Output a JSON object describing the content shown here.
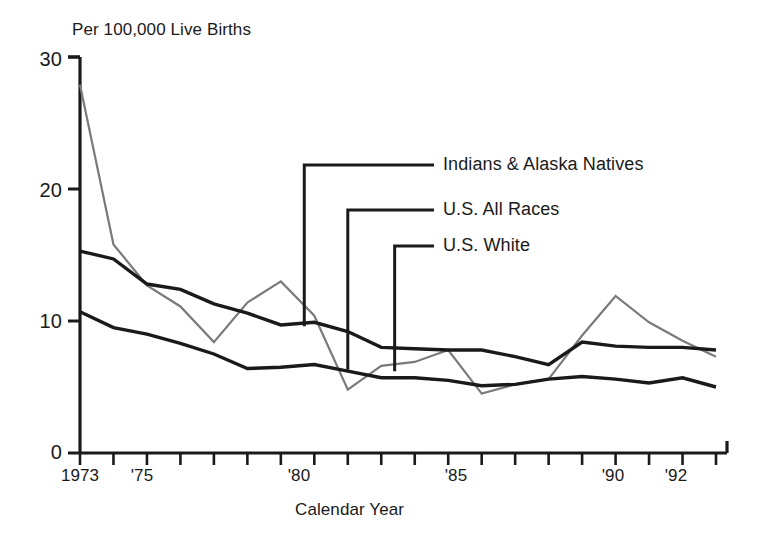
{
  "chart_data": {
    "type": "line",
    "title": "Per 100,000 Live Births",
    "subtitle": "",
    "xlabel": "Calendar Year",
    "ylabel": "Per 100,000 Live Births",
    "xlim": [
      1973,
      1992
    ],
    "ylim": [
      0,
      30
    ],
    "yticks": [
      0,
      10,
      20,
      30
    ],
    "ytick_labels": [
      "0",
      "10",
      "20",
      "30"
    ],
    "xticks": [
      1973,
      1974,
      1975,
      1976,
      1977,
      1978,
      1979,
      1980,
      1981,
      1982,
      1983,
      1984,
      1985,
      1986,
      1987,
      1988,
      1989,
      1990,
      1991,
      1992
    ],
    "xtick_labels_shown": [
      {
        "year": 1973,
        "label": "1973"
      },
      {
        "year": 1975,
        "label": "'75"
      },
      {
        "year": 1980,
        "label": "'80"
      },
      {
        "year": 1985,
        "label": "'85"
      },
      {
        "year": 1990,
        "label": "'90"
      },
      {
        "year": 1992,
        "label": "'92"
      }
    ],
    "grid": false,
    "legend_position": "inline-leader-lines",
    "x": [
      1973,
      1974,
      1975,
      1976,
      1977,
      1978,
      1979,
      1980,
      1981,
      1982,
      1983,
      1984,
      1985,
      1986,
      1987,
      1988,
      1989,
      1990,
      1991,
      1992
    ],
    "series": [
      {
        "name": "Indians & Alaska Natives",
        "color": "#7a7a7a",
        "values": [
          27.9,
          15.8,
          12.7,
          11.1,
          8.4,
          11.4,
          13.0,
          10.4,
          4.8,
          6.6,
          6.9,
          7.8,
          4.5,
          5.2,
          5.6,
          8.9,
          11.9,
          9.9,
          8.5,
          7.3
        ]
      },
      {
        "name": "U.S. All Races",
        "color": "#1a1a1a",
        "values": [
          15.3,
          14.7,
          12.8,
          12.4,
          11.3,
          10.6,
          9.7,
          9.9,
          9.2,
          8.0,
          7.9,
          7.8,
          7.8,
          7.3,
          6.7,
          8.4,
          8.1,
          8.0,
          8.0,
          7.8
        ]
      },
      {
        "name": "U.S. White",
        "color": "#1a1a1a",
        "values": [
          10.7,
          9.5,
          9.0,
          8.3,
          7.5,
          6.4,
          6.5,
          6.7,
          6.2,
          5.7,
          5.7,
          5.5,
          5.1,
          5.2,
          5.6,
          5.8,
          5.6,
          5.3,
          5.7,
          5.0
        ]
      }
    ],
    "annotations": [
      {
        "label": "Indians & Alaska Natives",
        "leader_from_year": 1979.7,
        "leader_from_value": 9.6
      },
      {
        "label": "U.S. All Races",
        "leader_from_year": 1981.0,
        "leader_from_value": 6.3
      },
      {
        "label": "U.S. White",
        "leader_from_year": 1982.4,
        "leader_from_value": 6.2
      }
    ]
  },
  "axes": {
    "y_tick_labels": [
      "30",
      "20",
      "10",
      "0"
    ],
    "x_tick_labels": [
      "1973",
      "'75",
      "'80",
      "'85",
      "'90",
      "'92"
    ],
    "x_axis_title": "Calendar Year",
    "plot_title": "Per 100,000 Live Births"
  },
  "legend": {
    "entries": [
      {
        "label": "Indians & Alaska Natives"
      },
      {
        "label": "U.S. All Races"
      },
      {
        "label": "U.S. White"
      }
    ]
  },
  "colors": {
    "axis": "#1a1a1a",
    "series_primary": "#1a1a1a",
    "series_secondary": "#7a7a7a",
    "background": "#ffffff"
  }
}
